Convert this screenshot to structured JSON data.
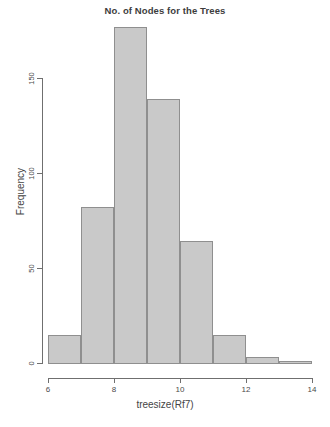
{
  "chart_data": {
    "type": "bar",
    "title": "No. of Nodes for the Trees",
    "xlabel": "treesize(Rf7)",
    "ylabel": "Frequency",
    "bin_edges": [
      6,
      7,
      8,
      9,
      10,
      11,
      12,
      13,
      14
    ],
    "categories": [
      "6-7",
      "7-8",
      "8-9",
      "9-10",
      "10-11",
      "11-12",
      "12-13",
      "13-14"
    ],
    "values": [
      15,
      82,
      177,
      139,
      64,
      15,
      3,
      1
    ],
    "xlim": [
      6,
      14
    ],
    "ylim": [
      0,
      150
    ],
    "xticks": [
      6,
      8,
      10,
      12,
      14
    ],
    "xtick_labels": [
      "6",
      "8",
      "10",
      "12",
      "14"
    ],
    "yticks": [
      0,
      50,
      100,
      150
    ],
    "ytick_labels": [
      "0",
      "50",
      "100",
      "150"
    ],
    "grid": false,
    "legend": null,
    "bar_fill_color": "#c9c9c9",
    "bar_border_color": "#8f8f8f",
    "axis_color": "#6f6f6f"
  }
}
